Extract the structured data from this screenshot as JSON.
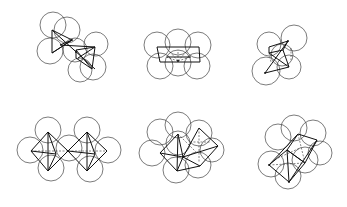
{
  "figure": {
    "colors": {
      "background": "#ffffff",
      "stroke": "#111111",
      "sphere": "#444444"
    },
    "panels": [
      {
        "id": "top-left",
        "row": 1,
        "col": 1,
        "shape": "two-tetrahedra-sharing-vertex"
      },
      {
        "id": "top-center",
        "row": 1,
        "col": 2,
        "shape": "square-prism-fan"
      },
      {
        "id": "top-right",
        "row": 1,
        "col": 3,
        "shape": "tilted-bipyramid"
      },
      {
        "id": "bottom-left",
        "row": 2,
        "col": 1,
        "shape": "two-octahedra-vertex-sharing"
      },
      {
        "id": "bottom-center",
        "row": 2,
        "col": 2,
        "shape": "two-octahedra-offset"
      },
      {
        "id": "bottom-right",
        "row": 2,
        "col": 3,
        "shape": "octahedra-edge-sharing-tilted"
      }
    ]
  }
}
